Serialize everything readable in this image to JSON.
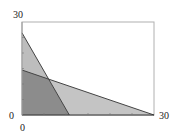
{
  "chart_data": {
    "type": "area",
    "title": "",
    "xlabel": "",
    "ylabel": "",
    "xlim": [
      0,
      30
    ],
    "ylim": [
      0,
      30
    ],
    "grid": false,
    "legend": null,
    "x_tick_labels": [
      "0",
      "30"
    ],
    "y_tick_labels": [
      "0",
      "30"
    ],
    "series": [
      {
        "name": "steep-constraint-region",
        "kind": "triangle",
        "points": [
          [
            0,
            0
          ],
          [
            0,
            26.5
          ],
          [
            10.75,
            0
          ]
        ],
        "boundary_line": {
          "from": [
            0,
            26.5
          ],
          "to": [
            10.75,
            0
          ]
        },
        "color": "#bdbdbd"
      },
      {
        "name": "shallow-constraint-region",
        "kind": "triangle",
        "points": [
          [
            0,
            0
          ],
          [
            0,
            14.5
          ],
          [
            30,
            0
          ]
        ],
        "boundary_line": {
          "from": [
            0,
            14.5
          ],
          "to": [
            30,
            0
          ]
        },
        "color": "#c4c4c4"
      },
      {
        "name": "overlap-region",
        "kind": "polygon",
        "points": [
          [
            0,
            0
          ],
          [
            0,
            14.5
          ],
          [
            6.0,
            11.6
          ],
          [
            10.75,
            0
          ]
        ],
        "color": "#8c8c8c"
      }
    ],
    "annotations": []
  },
  "colors": {
    "frame": "#b0b0b0",
    "axis": "#333333",
    "line": "#444444",
    "light_fill": "#c2c2c2",
    "dark_fill": "#8c8c8c"
  },
  "layout": {
    "plot_left": 22,
    "plot_top": 22,
    "plot_right": 154,
    "plot_bottom": 115
  }
}
